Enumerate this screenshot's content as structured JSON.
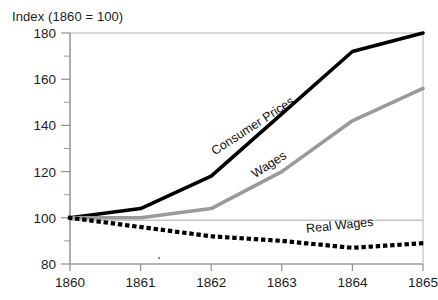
{
  "chart_data": {
    "type": "line",
    "title": "Index (1860 = 100)",
    "xlabel": "",
    "ylabel": "",
    "x": [
      1860,
      1861,
      1862,
      1863,
      1864,
      1865
    ],
    "categories": [
      "1860",
      "1861",
      "1862",
      "1863",
      "1864",
      "1865"
    ],
    "xlim": [
      1860,
      1865
    ],
    "ylim": [
      80,
      180
    ],
    "yticks": [
      80,
      100,
      120,
      140,
      160,
      180
    ],
    "ytick_labels": [
      "80",
      "100",
      "120",
      "140",
      "160",
      "180"
    ],
    "yminor_ticks": [
      90,
      110,
      130,
      150,
      170
    ],
    "xticks": [
      1860,
      1861,
      1862,
      1863,
      1864,
      1865
    ],
    "xtick_labels": [
      "1860",
      "1861",
      "1862",
      "1863",
      "1864",
      "1865"
    ],
    "grid": false,
    "reference_line": 100,
    "legend": "inline-labels",
    "series": [
      {
        "name": "Consumer Prices",
        "color": "#000000",
        "style": "solid",
        "width": 3.6,
        "values": [
          100,
          104,
          118,
          145,
          172,
          180
        ],
        "label_x": 1862.05,
        "label_y": 127,
        "label_rotation": -33
      },
      {
        "name": "Wages",
        "color": "#9a9a9a",
        "style": "solid",
        "width": 3.6,
        "values": [
          100,
          100,
          104,
          120,
          142,
          156
        ],
        "label_x": 1862.62,
        "label_y": 117,
        "label_rotation": -33
      },
      {
        "name": "Real Wages",
        "color": "#000000",
        "style": "dotted",
        "width": 4.2,
        "values": [
          100,
          96,
          92,
          90,
          87,
          89
        ],
        "label_x": 1863.35,
        "label_y": 93.5,
        "label_rotation": -6
      }
    ]
  },
  "axes": {
    "title": "Index (1860 = 100)"
  }
}
